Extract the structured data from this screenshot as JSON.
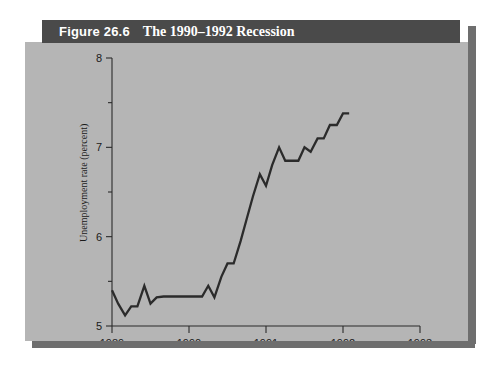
{
  "figure": {
    "number_label": "Figure 26.6",
    "caption": "The 1990–1992 Recession",
    "banner_color": "#4a4a4a",
    "panel_color": "#b5b5b5",
    "shadow_color": "#6e6e6e",
    "line_color": "#2b2b2b"
  },
  "chart_data": {
    "type": "line",
    "title": "The 1990–1992 Recession",
    "xlabel": "",
    "ylabel": "Unemployment rate (percent)",
    "xlim": [
      1989.0,
      1993.0
    ],
    "ylim": [
      5.0,
      8.0
    ],
    "grid": false,
    "legend": null,
    "x_ticks": [
      1989,
      1990,
      1991,
      1992,
      1993
    ],
    "x_tick_labels": [
      "1989",
      "1990",
      "1991",
      "1992",
      "1993"
    ],
    "y_ticks": [
      5,
      6,
      7,
      8
    ],
    "y_tick_labels": [
      "5",
      "6",
      "7",
      "8"
    ],
    "y_minor_ticks": [
      5.5,
      6.5,
      7.5
    ],
    "series": [
      {
        "name": "Unemployment rate",
        "x": [
          1989.0,
          1989.08,
          1989.17,
          1989.25,
          1989.33,
          1989.42,
          1989.5,
          1989.58,
          1989.67,
          1989.75,
          1989.83,
          1989.92,
          1990.0,
          1990.08,
          1990.17,
          1990.25,
          1990.33,
          1990.42,
          1990.5,
          1990.58,
          1990.67,
          1990.75,
          1990.83,
          1990.92,
          1991.0,
          1991.08,
          1991.17,
          1991.25,
          1991.33,
          1991.42,
          1991.5,
          1991.58,
          1991.67,
          1991.75,
          1991.83,
          1991.92,
          1992.0,
          1992.08
        ],
        "y": [
          5.4,
          5.25,
          5.12,
          5.22,
          5.22,
          5.45,
          5.25,
          5.32,
          5.33,
          5.33,
          5.33,
          5.33,
          5.33,
          5.33,
          5.33,
          5.45,
          5.32,
          5.55,
          5.7,
          5.7,
          5.95,
          6.2,
          6.45,
          6.7,
          6.57,
          6.8,
          7.0,
          6.85,
          6.85,
          6.85,
          7.0,
          6.95,
          7.1,
          7.1,
          7.25,
          7.25,
          7.38,
          7.38
        ]
      }
    ]
  }
}
